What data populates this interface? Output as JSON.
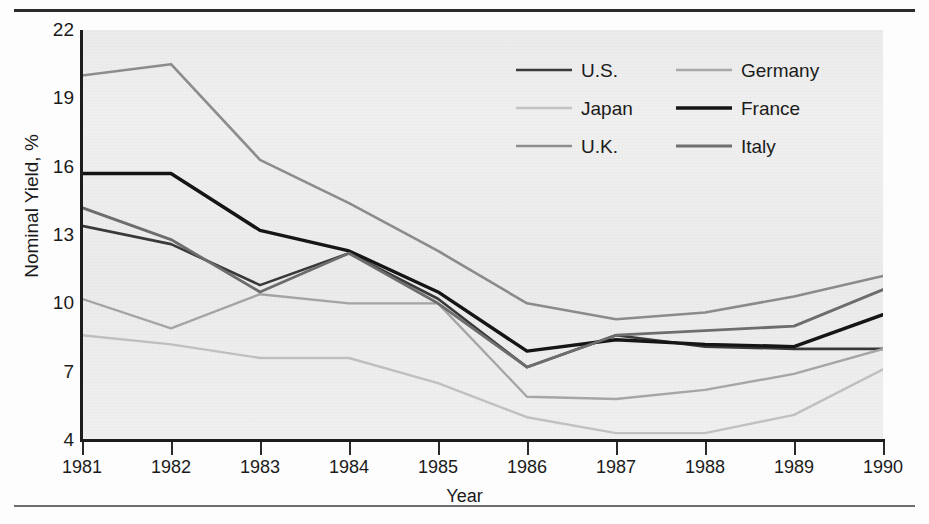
{
  "chart_data": {
    "type": "line",
    "title": "",
    "xlabel": "Year",
    "ylabel": "Nominal Yield, %",
    "grid": false,
    "legend_position": "top-right",
    "x": [
      1981,
      1982,
      1983,
      1984,
      1985,
      1986,
      1987,
      1988,
      1989,
      1990
    ],
    "categories": [
      "1981",
      "1982",
      "1983",
      "1984",
      "1985",
      "1986",
      "1987",
      "1988",
      "1989",
      "1990"
    ],
    "xlim": [
      1981,
      1990
    ],
    "ylim": [
      4,
      22
    ],
    "yticks": [
      22,
      19,
      16,
      13,
      10,
      7,
      4
    ],
    "ytick_labels": [
      "22",
      "19",
      "16",
      "13",
      "10",
      "7",
      "4"
    ],
    "series": [
      {
        "name": "U.S.",
        "color": "#3a3a3a",
        "width": 2.6,
        "values": [
          13.4,
          12.6,
          10.8,
          12.2,
          10.2,
          7.2,
          8.6,
          8.1,
          8.0,
          8.0
        ]
      },
      {
        "name": "Japan",
        "color": "#c2c2c2",
        "width": 2.4,
        "values": [
          8.6,
          8.2,
          7.6,
          7.6,
          6.5,
          5.0,
          4.3,
          4.3,
          5.1,
          7.1
        ]
      },
      {
        "name": "U.K.",
        "color": "#8e8e8e",
        "width": 2.6,
        "values": [
          20.0,
          20.5,
          16.3,
          14.4,
          12.3,
          10.0,
          9.3,
          9.6,
          10.3,
          11.2
        ]
      },
      {
        "name": "Germany",
        "color": "#a8a8a8",
        "width": 2.4,
        "values": [
          10.2,
          8.9,
          10.4,
          10.0,
          10.0,
          5.9,
          5.8,
          6.2,
          6.9,
          8.0
        ]
      },
      {
        "name": "France",
        "color": "#151515",
        "width": 3.4,
        "values": [
          15.7,
          15.7,
          13.2,
          12.3,
          10.5,
          7.9,
          8.4,
          8.2,
          8.1,
          9.5
        ]
      },
      {
        "name": "Italy",
        "color": "#6f6f6f",
        "width": 2.8,
        "values": [
          14.2,
          12.8,
          10.5,
          12.2,
          10.0,
          7.2,
          8.6,
          8.8,
          9.0,
          10.6
        ]
      }
    ],
    "legend_order": [
      "U.S.",
      "Germany",
      "Japan",
      "France",
      "U.K.",
      "Italy"
    ]
  },
  "axes": {
    "y_title": "Nominal Yield, %",
    "x_title": "Year"
  }
}
